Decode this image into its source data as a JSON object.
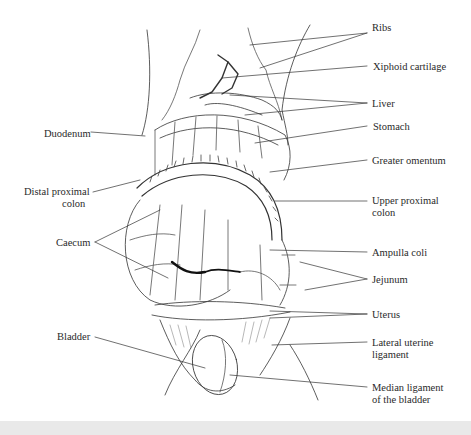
{
  "diagram": {
    "labels_right": [
      {
        "id": "ribs",
        "text": "Ribs",
        "x": 372,
        "y": 28
      },
      {
        "id": "xiphoid",
        "text": "Xiphoid cartilage",
        "x": 373,
        "y": 61
      },
      {
        "id": "liver",
        "text": "Liver",
        "x": 372,
        "y": 98
      },
      {
        "id": "stomach",
        "text": "Stomach",
        "x": 373,
        "y": 121
      },
      {
        "id": "greater-omentum",
        "text": "Greater omentum",
        "x": 372,
        "y": 155
      },
      {
        "id": "upper-proximal-colon-1",
        "text": "Upper proximal",
        "x": 372,
        "y": 195
      },
      {
        "id": "upper-proximal-colon-2",
        "text": "colon",
        "x": 372,
        "y": 207
      },
      {
        "id": "ampulla-coli",
        "text": "Ampulla coli",
        "x": 372,
        "y": 247
      },
      {
        "id": "jejunum",
        "text": "Jejunum",
        "x": 372,
        "y": 274
      },
      {
        "id": "uterus",
        "text": "Uterus",
        "x": 372,
        "y": 309
      },
      {
        "id": "lateral-uterine-1",
        "text": "Lateral uterine",
        "x": 372,
        "y": 337
      },
      {
        "id": "lateral-uterine-2",
        "text": "ligament",
        "x": 372,
        "y": 349
      },
      {
        "id": "median-ligament-1",
        "text": "Median ligament",
        "x": 372,
        "y": 382
      },
      {
        "id": "median-ligament-2",
        "text": "of the bladder",
        "x": 372,
        "y": 394
      }
    ],
    "labels_left": [
      {
        "id": "duodenum",
        "text": "Duodenum",
        "x": 44,
        "y": 128
      },
      {
        "id": "distal-proximal-colon-1",
        "text": "Distal proximal",
        "x": 24,
        "y": 188
      },
      {
        "id": "distal-proximal-colon-2",
        "text": "colon",
        "x": 56,
        "y": 200
      },
      {
        "id": "caecum",
        "text": "Caecum",
        "x": 56,
        "y": 238
      },
      {
        "id": "bladder",
        "text": "Bladder",
        "x": 57,
        "y": 333
      }
    ]
  }
}
